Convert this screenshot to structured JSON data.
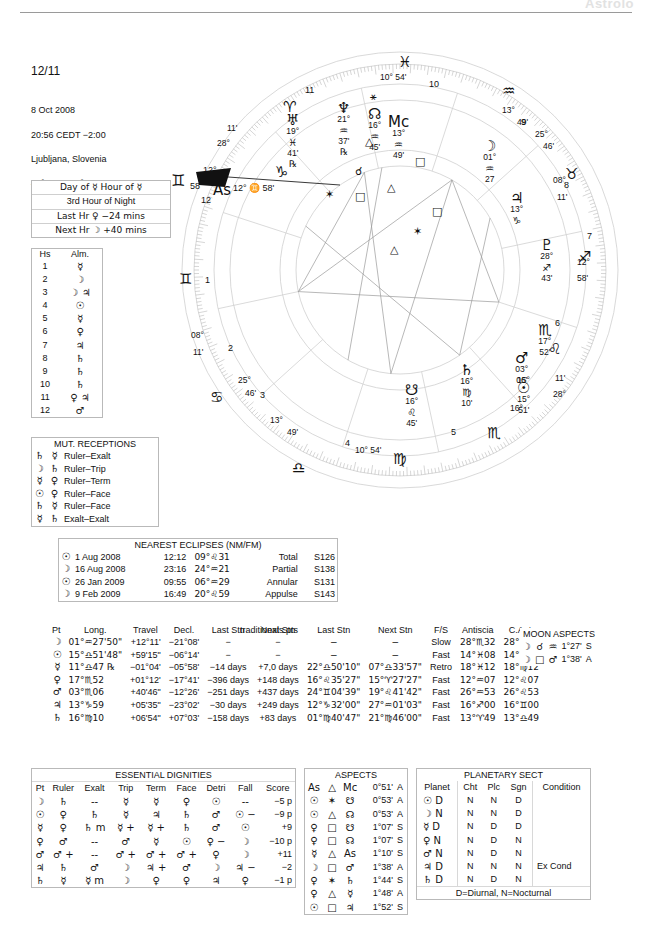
{
  "watermark": "Astrolo",
  "header": {
    "page_number": "12/11",
    "date": "8 Oct 2008",
    "time": "20:56  CEDT −2:00",
    "place": "Ljubljana, Slovenia",
    "coords": "46°N03' 014°E31'"
  },
  "planetary_hour": {
    "line1": "Day of  ☿   Hour of  ☿",
    "line2": "3rd Hour of Night",
    "line3": "Last Hr  ♀  −24 mins",
    "line4": "Next Hr  ☽  +40 mins"
  },
  "houses_almuten": {
    "col_house": "Hs",
    "col_almuten": "Alm.",
    "rows": [
      {
        "hs": "1",
        "alm": "☿"
      },
      {
        "hs": "2",
        "alm": "☽"
      },
      {
        "hs": "3",
        "alm": "☽ ♃"
      },
      {
        "hs": "4",
        "alm": "☉"
      },
      {
        "hs": "5",
        "alm": "☿"
      },
      {
        "hs": "6",
        "alm": "♀"
      },
      {
        "hs": "7",
        "alm": "♃"
      },
      {
        "hs": "8",
        "alm": "♄"
      },
      {
        "hs": "9",
        "alm": "♄"
      },
      {
        "hs": "10",
        "alm": "♄"
      },
      {
        "hs": "11",
        "alm": "♀ ♃"
      },
      {
        "hs": "12",
        "alm": "♂"
      }
    ]
  },
  "mutual_receptions": {
    "title": "MUT. RECEPTIONS",
    "rows": [
      {
        "a": "♄",
        "b": "☿",
        "type": "Ruler–Exalt"
      },
      {
        "a": "☽",
        "b": "♄",
        "type": "Ruler–Trip"
      },
      {
        "a": "☿",
        "b": "♀",
        "type": "Ruler–Term"
      },
      {
        "a": "☉",
        "b": "♀",
        "type": "Ruler–Face"
      },
      {
        "a": "♄",
        "b": "☿",
        "type": "Ruler–Face"
      },
      {
        "a": "☿",
        "b": "♄",
        "type": "Exalt–Exalt"
      }
    ]
  },
  "eclipses": {
    "title": "NEAREST ECLIPSES (NM/FM)",
    "rows": [
      {
        "body": "☉",
        "date": "1 Aug 2008",
        "time": "12:12",
        "position": "09°♌31",
        "kind": "Total",
        "saros": "S126"
      },
      {
        "body": "☽",
        "date": "16 Aug 2008",
        "time": "23:16",
        "position": "24°♒21",
        "kind": "Partial",
        "saros": "S138"
      },
      {
        "body": "☉",
        "date": "26 Jan 2009",
        "time": "09:55",
        "position": "06°♒29",
        "kind": "Annular",
        "saros": "S131"
      },
      {
        "body": "☽",
        "date": "9 Feb 2009",
        "time": "16:49",
        "position": "20°♌59",
        "kind": "Appulse",
        "saros": "S143"
      }
    ]
  },
  "positions": {
    "file_label": "traditionals.pts",
    "headers": [
      "Pt",
      "Long.",
      "Travel",
      "Decl.",
      "Last Stn",
      "Next Stn",
      "Last Stn",
      "Next Stn",
      "F/S",
      "Antiscia",
      "C.Ant."
    ],
    "rows": [
      {
        "pt": "☽",
        "long": "01°♒27'50\"",
        "travel": "+12°11'",
        "decl": "−21°08'",
        "last_stn_d": "−",
        "next_stn_d": "−",
        "last_stn_p": "−",
        "next_stn_p": "−",
        "fs": "Slow",
        "antiscia": "28°♏32",
        "cant": "28°♉32"
      },
      {
        "pt": "☉",
        "long": "15°♎51'48\"",
        "travel": "+59'15\"",
        "decl": "−06°14'",
        "last_stn_d": "−",
        "next_stn_d": "−",
        "last_stn_p": "−",
        "next_stn_p": "−",
        "fs": "Fast",
        "antiscia": "14°♓08",
        "cant": "14°♍08"
      },
      {
        "pt": "☿",
        "long": "11°♎47 ℞",
        "travel": "−01°04'",
        "decl": "−05°58'",
        "last_stn_d": "−14 days",
        "next_stn_d": "+7,0 days",
        "last_stn_p": "22°♎50'10\"",
        "next_stn_p": "07°♎33'57\"",
        "fs": "Retro",
        "antiscia": "18°♓12",
        "cant": "18°♍12"
      },
      {
        "pt": "♀",
        "long": "17°♏52",
        "travel": "+01°12'",
        "decl": "−17°41'",
        "last_stn_d": "−396 days",
        "next_stn_d": "+148 days",
        "last_stn_p": "16°♌35'27\"",
        "next_stn_p": "15°♈27'27\"",
        "fs": "Fast",
        "antiscia": "12°♒07",
        "cant": "12°♌07"
      },
      {
        "pt": "♂",
        "long": "03°♏06",
        "travel": "+40'46\"",
        "decl": "−12°26'",
        "last_stn_d": "−251 days",
        "next_stn_d": "+437 days",
        "last_stn_p": "24°♊04'39\"",
        "next_stn_p": "19°♌41'42\"",
        "fs": "Fast",
        "antiscia": "26°♒53",
        "cant": "26°♌53"
      },
      {
        "pt": "♃",
        "long": "13°♑59",
        "travel": "+05'35\"",
        "decl": "−23°02'",
        "last_stn_d": "−30 days",
        "next_stn_d": "+249 days",
        "last_stn_p": "12°♑32'00\"",
        "next_stn_p": "27°♒01'03\"",
        "fs": "Fast",
        "antiscia": "16°♐00",
        "cant": "16°♊00"
      },
      {
        "pt": "♄",
        "long": "16°♍10",
        "travel": "+06'54\"",
        "decl": "+07°03'",
        "last_stn_d": "−158 days",
        "next_stn_d": "+83 days",
        "last_stn_p": "01°♍40'47\"",
        "next_stn_p": "21°♍46'00\"",
        "fs": "Fast",
        "antiscia": "13°♈49",
        "cant": "13°♎49"
      }
    ]
  },
  "moon_aspects": {
    "title": "MOON ASPECTS",
    "rows": [
      {
        "a": "☽",
        "asp": "☌",
        "b": "♒",
        "orb": "1°27'",
        "ap": "S"
      },
      {
        "a": "☽",
        "asp": "□",
        "b": "♂",
        "orb": "1°38'",
        "ap": "A"
      }
    ]
  },
  "essential_dignities": {
    "title": "ESSENTIAL DIGNITIES",
    "headers": [
      "Pt",
      "Ruler",
      "Exalt",
      "Trip",
      "Term",
      "Face",
      "Detri",
      "Fall",
      "Score"
    ],
    "rows": [
      {
        "pt": "☽",
        "ruler": "♄",
        "ruler_m": "",
        "exalt": "--",
        "exalt_m": "",
        "trip": "☿",
        "trip_m": "",
        "term": "☿",
        "term_m": "",
        "face": "♀",
        "face_m": "",
        "detri": "☉",
        "detri_m": "",
        "fall": "--",
        "fall_m": "",
        "score": "−5 p"
      },
      {
        "pt": "☉",
        "ruler": "♀",
        "ruler_m": "",
        "exalt": "♄",
        "exalt_m": "",
        "trip": "☿",
        "trip_m": "",
        "term": "♃",
        "term_m": "",
        "face": "♄",
        "face_m": "",
        "detri": "♂",
        "detri_m": "",
        "fall": "☉",
        "fall_m": "−",
        "score": "−9 p"
      },
      {
        "pt": "☿",
        "ruler": "♀",
        "ruler_m": "",
        "exalt": "♄",
        "exalt_m": "m",
        "trip": "☿",
        "trip_m": "+",
        "term": "☿",
        "term_m": "+",
        "face": "♄",
        "face_m": "",
        "detri": "♂",
        "detri_m": "",
        "fall": "☉",
        "fall_m": "",
        "score": "+9"
      },
      {
        "pt": "♀",
        "ruler": "♂",
        "ruler_m": "",
        "exalt": "--",
        "exalt_m": "",
        "trip": "♂",
        "trip_m": "",
        "term": "☿",
        "term_m": "",
        "face": "☉",
        "face_m": "",
        "detri": "♀",
        "detri_m": "−",
        "fall": "☽",
        "fall_m": "",
        "score": "−10 p"
      },
      {
        "pt": "♂",
        "ruler": "♂",
        "ruler_m": "+",
        "exalt": "--",
        "exalt_m": "",
        "trip": "♂",
        "trip_m": "+",
        "term": "♂",
        "term_m": "+",
        "face": "♂",
        "face_m": "+",
        "detri": "♀",
        "detri_m": "",
        "fall": "☽",
        "fall_m": "",
        "score": "+11"
      },
      {
        "pt": "♃",
        "ruler": "♄",
        "ruler_m": "",
        "exalt": "♂",
        "exalt_m": "",
        "trip": "☽",
        "trip_m": "",
        "term": "♃",
        "term_m": "+",
        "face": "♂",
        "face_m": "",
        "detri": "☽",
        "detri_m": "",
        "fall": "♃",
        "fall_m": "−",
        "score": "−2"
      },
      {
        "pt": "♄",
        "ruler": "☿",
        "ruler_m": "",
        "exalt": "☿",
        "exalt_m": "m",
        "trip": "☽",
        "trip_m": "",
        "term": "♀",
        "term_m": "",
        "face": "♀",
        "face_m": "",
        "detri": "♃",
        "detri_m": "",
        "fall": "♀",
        "fall_m": "",
        "score": "−1 p"
      }
    ]
  },
  "aspects": {
    "title": "ASPECTS",
    "rows": [
      {
        "a": "As",
        "asp": "△",
        "b": "Mc",
        "orb": "0°51'",
        "ap": "A"
      },
      {
        "a": "☉",
        "asp": "✶",
        "b": "☋",
        "orb": "0°53'",
        "ap": "A"
      },
      {
        "a": "☉",
        "asp": "△",
        "b": "☊",
        "orb": "0°53'",
        "ap": "A"
      },
      {
        "a": "♀",
        "asp": "□",
        "b": "☋",
        "orb": "1°07'",
        "ap": "S"
      },
      {
        "a": "♀",
        "asp": "□",
        "b": "☊",
        "orb": "1°07'",
        "ap": "S"
      },
      {
        "a": "☿",
        "asp": "△",
        "b": "As",
        "orb": "1°10'",
        "ap": "S"
      },
      {
        "a": "☽",
        "asp": "□",
        "b": "♂",
        "orb": "1°38'",
        "ap": "A"
      },
      {
        "a": "♀",
        "asp": "✶",
        "b": "♄",
        "orb": "1°44'",
        "ap": "S"
      },
      {
        "a": "♀",
        "asp": "△",
        "b": "☿",
        "orb": "1°48'",
        "ap": "A"
      },
      {
        "a": "☉",
        "asp": "□",
        "b": "♃",
        "orb": "1°52'",
        "ap": "S"
      }
    ]
  },
  "planetary_sect": {
    "title": "PLANETARY SECT",
    "headers": [
      "Planet",
      "Cht",
      "Plc",
      "Sgn",
      "Condition"
    ],
    "rows": [
      {
        "planet": "☉",
        "d": "D",
        "cht": "N",
        "plc": "N",
        "sgn": "D",
        "condition": ""
      },
      {
        "planet": "☽",
        "d": "N",
        "cht": "N",
        "plc": "N",
        "sgn": "D",
        "condition": ""
      },
      {
        "planet": "☿",
        "d": "D",
        "cht": "N",
        "plc": "D",
        "sgn": "D",
        "condition": ""
      },
      {
        "planet": "♀",
        "d": "N",
        "cht": "N",
        "plc": "D",
        "sgn": "N",
        "condition": ""
      },
      {
        "planet": "♂",
        "d": "N",
        "cht": "N",
        "plc": "D",
        "sgn": "N",
        "condition": ""
      },
      {
        "planet": "♃",
        "d": "D",
        "cht": "N",
        "plc": "N",
        "sgn": "N",
        "condition": "Ex Cond"
      },
      {
        "planet": "♄",
        "d": "D",
        "cht": "N",
        "plc": "D",
        "sgn": "N",
        "condition": ""
      }
    ],
    "footnote": "D=Diurnal, N=Nocturnal"
  },
  "wheel": {
    "ascendant_label": "12° ♊ 58'",
    "as_text": "As",
    "mc_text": "Mc",
    "zodiac_glyphs": [
      {
        "glyph": "♓",
        "x": 233,
        "y": 18
      },
      {
        "glyph": "♈",
        "x": 118,
        "y": 63
      },
      {
        "glyph": "♒",
        "x": 337,
        "y": 47
      },
      {
        "glyph": "♑",
        "x": 110,
        "y": 128
      },
      {
        "glyph": "♐",
        "x": 413,
        "y": 213
      },
      {
        "glyph": "♊",
        "x": 14,
        "y": 235
      },
      {
        "glyph": "♌",
        "x": 383,
        "y": 305
      },
      {
        "glyph": "♋",
        "x": 45,
        "y": 353
      },
      {
        "glyph": "♏",
        "x": 322,
        "y": 389
      },
      {
        "glyph": "♍",
        "x": 228,
        "y": 415
      },
      {
        "glyph": "♎",
        "x": 127,
        "y": 424
      },
      {
        "glyph": "♉",
        "x": 400,
        "y": 130
      }
    ],
    "cusps": [
      {
        "num": "11",
        "x": 140,
        "y": 50
      },
      {
        "num": "10",
        "x": 264,
        "y": 44
      },
      {
        "num": "9",
        "x": 356,
        "y": 82
      },
      {
        "num": "8",
        "x": 399,
        "y": 145
      },
      {
        "num": "7",
        "x": 422,
        "y": 196
      },
      {
        "num": "6",
        "x": 390,
        "y": 283
      },
      {
        "num": "5",
        "x": 286,
        "y": 392
      },
      {
        "num": "4",
        "x": 180,
        "y": 403
      },
      {
        "num": "3",
        "x": 95,
        "y": 355
      },
      {
        "num": "2",
        "x": 63,
        "y": 308
      },
      {
        "num": "1",
        "x": 40,
        "y": 240
      },
      {
        "num": "12",
        "x": 36,
        "y": 160
      }
    ],
    "cusp_degrees": [
      {
        "deg": "10° 54'",
        "x": 215,
        "y": 37
      },
      {
        "deg": "13°",
        "x": 337,
        "y": 70
      },
      {
        "deg": "49'",
        "x": 352,
        "y": 82
      },
      {
        "deg": "25°",
        "x": 370,
        "y": 94
      },
      {
        "deg": "46'",
        "x": 378,
        "y": 106
      },
      {
        "deg": "08°",
        "x": 388,
        "y": 140
      },
      {
        "deg": "11'",
        "x": 392,
        "y": 157
      },
      {
        "deg": "12°",
        "x": 412,
        "y": 222
      },
      {
        "deg": "58'",
        "x": 412,
        "y": 238
      },
      {
        "deg": "11'",
        "x": 390,
        "y": 338
      },
      {
        "deg": "28°",
        "x": 388,
        "y": 354
      },
      {
        "deg": "16°",
        "x": 345,
        "y": 368
      },
      {
        "deg": "15°",
        "x": 352,
        "y": 340
      },
      {
        "deg": "10° 54'",
        "x": 190,
        "y": 410
      },
      {
        "deg": "13°",
        "x": 105,
        "y": 380
      },
      {
        "deg": "49'",
        "x": 122,
        "y": 392
      },
      {
        "deg": "25°",
        "x": 73,
        "y": 340
      },
      {
        "deg": "46'",
        "x": 80,
        "y": 353
      },
      {
        "deg": "08°",
        "x": 26,
        "y": 295
      },
      {
        "deg": "11'",
        "x": 28,
        "y": 312
      },
      {
        "deg": "11'",
        "x": 62,
        "y": 88
      },
      {
        "deg": "28°",
        "x": 52,
        "y": 103
      }
    ],
    "planets": [
      {
        "glyph": "♅",
        "deg": "19°",
        "sign": "♓",
        "min": "41'",
        "retro": "℞",
        "x": 121,
        "y": 80
      },
      {
        "glyph": "♆",
        "deg": "21°",
        "sign": "♒",
        "min": "37'",
        "retro": "℞",
        "x": 172,
        "y": 68
      },
      {
        "glyph": "☊",
        "deg": "16°",
        "sign": "♒",
        "min": "45'",
        "retro": "",
        "x": 203,
        "y": 74
      },
      {
        "glyph": "Mc",
        "deg": "13°",
        "sign": "♒",
        "min": "49'",
        "retro": "",
        "x": 223,
        "y": 82
      },
      {
        "glyph": "☽",
        "deg": "01°",
        "sign": "♒",
        "min": "27",
        "retro": "",
        "x": 318,
        "y": 106
      },
      {
        "glyph": "♃",
        "deg": "13°",
        "sign": "♑",
        "min": "",
        "retro": "",
        "x": 345,
        "y": 158
      },
      {
        "glyph": "♇",
        "deg": "28°",
        "sign": "♐",
        "min": "43'",
        "retro": "",
        "x": 375,
        "y": 205
      },
      {
        "glyph": "♏",
        "deg": "17°",
        "sign": "",
        "min": "52'",
        "retro": "",
        "x": 373,
        "y": 290
      },
      {
        "glyph": "♂",
        "deg": "03°",
        "sign": "",
        "min": "06'",
        "retro": "",
        "x": 350,
        "y": 318
      },
      {
        "glyph": "☉",
        "deg": "15°",
        "sign": "",
        "min": "51'",
        "retro": "",
        "x": 352,
        "y": 348
      },
      {
        "glyph": "♄",
        "deg": "16°",
        "sign": "♍",
        "min": "10'",
        "retro": "",
        "x": 295,
        "y": 330
      },
      {
        "glyph": "☋",
        "deg": "16°",
        "sign": "♌",
        "min": "45'",
        "retro": "",
        "x": 240,
        "y": 350
      }
    ]
  }
}
